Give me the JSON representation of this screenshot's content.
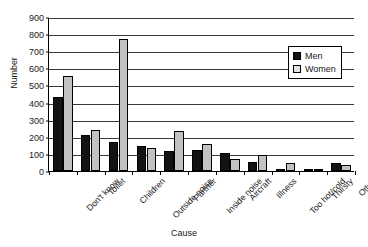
{
  "chart_data": {
    "type": "bar",
    "title": "",
    "xlabel": "Cause",
    "ylabel": "Number",
    "ylim": [
      0,
      900
    ],
    "ytick_step": 100,
    "yticks": [
      0,
      100,
      200,
      300,
      400,
      500,
      600,
      700,
      800,
      900
    ],
    "grid": true,
    "legend_position": "top-right",
    "categories": [
      "Don't know",
      "Toilet",
      "Children",
      "Outside noise",
      "Partner",
      "Inside noise",
      "Aircraft",
      "Illness",
      "Too hot/cold",
      "Thirsty",
      "Other"
    ],
    "series": [
      {
        "name": "Men",
        "color": "#131313",
        "values": [
          435,
          208,
          170,
          148,
          118,
          125,
          105,
          55,
          12,
          10,
          45
        ]
      },
      {
        "name": "Women",
        "color": "#c2c2c2",
        "values": [
          555,
          238,
          770,
          135,
          235,
          160,
          70,
          95,
          45,
          8,
          35
        ]
      }
    ]
  },
  "legend": {
    "entries": [
      {
        "label": "Men"
      },
      {
        "label": "Women"
      }
    ]
  }
}
